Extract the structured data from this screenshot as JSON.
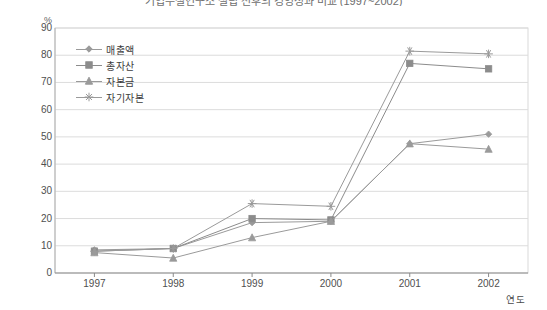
{
  "chart": {
    "title": "기업부설연구소 설립 전후의 경영성과 비교 (1997~2002)",
    "y_unit": "%",
    "x_axis_title": "연도"
  },
  "legend": {
    "position": "top-left-inside",
    "items": [
      {
        "label": "매출액",
        "marker": "diamond-marker",
        "color": "#9a9a9a"
      },
      {
        "label": "총자산",
        "marker": "square-marker",
        "color": "#8c8c8c"
      },
      {
        "label": "자본금",
        "marker": "triangle-marker",
        "color": "#9a9a9a"
      },
      {
        "label": "자기자본",
        "marker": "star-marker",
        "color": "#9a9a9a"
      }
    ]
  },
  "chart_data": {
    "type": "line",
    "title": "기업부설연구소 설립 전후의 경영성과 비교 (1997~2002)",
    "xlabel": "연도",
    "ylabel": "%",
    "categories": [
      "1997",
      "1998",
      "1999",
      "2000",
      "2001",
      "2002"
    ],
    "ylim": [
      0,
      90
    ],
    "yticks": [
      0,
      10,
      20,
      30,
      40,
      50,
      60,
      70,
      80,
      90
    ],
    "grid": true,
    "legend": "inside-top-left",
    "series": [
      {
        "name": "매출액",
        "marker": "diamond",
        "color": "#9a9a9a",
        "values": [
          8.5,
          9.0,
          18.5,
          19.0,
          47.5,
          51.0
        ]
      },
      {
        "name": "총자산",
        "marker": "square",
        "color": "#8c8c8c",
        "values": [
          8.0,
          9.0,
          20.0,
          19.5,
          77.0,
          75.0
        ]
      },
      {
        "name": "자본금",
        "marker": "triangle",
        "color": "#9a9a9a",
        "values": [
          7.5,
          5.5,
          13.0,
          19.0,
          47.5,
          45.5
        ]
      },
      {
        "name": "자기자본",
        "marker": "star",
        "color": "#9a9a9a",
        "values": [
          8.0,
          9.0,
          25.5,
          24.5,
          81.5,
          80.5
        ]
      }
    ]
  },
  "axes": {
    "ytick_labels": [
      "90",
      "80",
      "70",
      "60",
      "50",
      "40",
      "30",
      "20",
      "10",
      "0"
    ],
    "xtick_labels": [
      "1997",
      "1998",
      "1999",
      "2000",
      "2001",
      "2002"
    ]
  }
}
